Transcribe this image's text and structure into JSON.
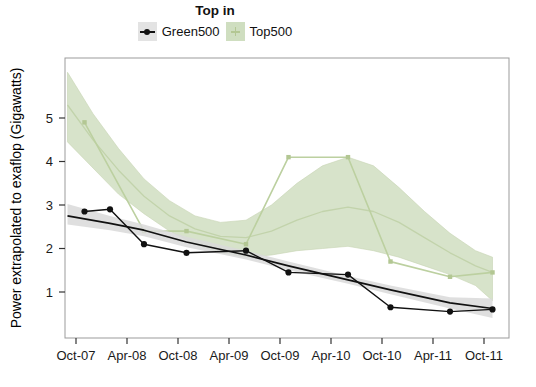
{
  "window": {
    "width": 536,
    "height": 387,
    "background": "#ffffff"
  },
  "legend": {
    "title": "Top in",
    "entries": [
      {
        "label": "Green500",
        "key": "line-with-point",
        "key_bg": "#e3e3e3",
        "color": "#111111"
      },
      {
        "label": "Top500",
        "key": "filled-ribbon",
        "key_bg": "#cfdec0",
        "color": "#b3c793"
      }
    ]
  },
  "chart_data": {
    "type": "line",
    "title": "Top in",
    "xlabel": "",
    "ylabel": "Power extrapolated to exaflop (Gigawatts)",
    "x_unit": "months since Oct-2007",
    "x_tick_labels": [
      "Oct-07",
      "Apr-08",
      "Oct-08",
      "Apr-09",
      "Oct-09",
      "Apr-10",
      "Oct-10",
      "Apr-11",
      "Oct-11"
    ],
    "x_tick_months": [
      0,
      6,
      12,
      18,
      24,
      30,
      36,
      42,
      48
    ],
    "y_ticks": [
      1,
      2,
      3,
      4,
      5
    ],
    "ylim": [
      0,
      6.4
    ],
    "xlim": [
      -1.5,
      50.5
    ],
    "grid": "off",
    "legend_position": "top",
    "series": [
      {
        "name": "Green500",
        "style": "jagged-line-with-circle-markers",
        "color": "#111111",
        "dates": [
          "Nov-07",
          "Feb-08",
          "Jun-08",
          "Nov-08",
          "Jun-09",
          "Nov-09",
          "Jun-10",
          "Nov-10",
          "Jun-11",
          "Nov-11"
        ],
        "x_months": [
          1,
          4,
          8,
          13,
          20,
          25,
          32,
          37,
          44,
          49
        ],
        "values": [
          2.85,
          2.9,
          2.1,
          1.9,
          1.95,
          1.45,
          1.4,
          0.65,
          0.55,
          0.6
        ]
      },
      {
        "name": "Top500",
        "style": "jagged-line-with-small-markers",
        "color": "#bcd0a0",
        "dates": [
          "Nov-07",
          "Jun-08",
          "Nov-08",
          "Jun-09",
          "Nov-09",
          "Jun-10",
          "Nov-10",
          "Jun-11",
          "Nov-11"
        ],
        "x_months": [
          1,
          8,
          13,
          20,
          25,
          32,
          37,
          44,
          49
        ],
        "values": [
          4.9,
          2.4,
          2.4,
          2.1,
          4.1,
          4.1,
          1.7,
          1.35,
          1.45
        ]
      }
    ],
    "smooths": [
      {
        "name": "Top500-trend",
        "line_color": "#c2d3ab",
        "ribbon_color": "#d3e0c4",
        "line": [
          [
            -1,
            5.3
          ],
          [
            2,
            4.5
          ],
          [
            5,
            3.8
          ],
          [
            8,
            3.2
          ],
          [
            11,
            2.75
          ],
          [
            14,
            2.45
          ],
          [
            17,
            2.28
          ],
          [
            20,
            2.25
          ],
          [
            23,
            2.4
          ],
          [
            26,
            2.65
          ],
          [
            29,
            2.85
          ],
          [
            32,
            2.95
          ],
          [
            35,
            2.85
          ],
          [
            38,
            2.6
          ],
          [
            41,
            2.25
          ],
          [
            44,
            1.9
          ],
          [
            47,
            1.6
          ],
          [
            49,
            1.45
          ]
        ],
        "ribbon_top": [
          [
            -1,
            6.05
          ],
          [
            2,
            5.1
          ],
          [
            5,
            4.3
          ],
          [
            8,
            3.6
          ],
          [
            11,
            3.1
          ],
          [
            14,
            2.75
          ],
          [
            17,
            2.6
          ],
          [
            20,
            2.65
          ],
          [
            23,
            3.0
          ],
          [
            26,
            3.5
          ],
          [
            29,
            3.9
          ],
          [
            32,
            4.1
          ],
          [
            35,
            3.9
          ],
          [
            38,
            3.4
          ],
          [
            41,
            2.85
          ],
          [
            44,
            2.35
          ],
          [
            47,
            1.95
          ],
          [
            49,
            1.8
          ]
        ],
        "ribbon_bottom": [
          [
            -1,
            4.45
          ],
          [
            2,
            3.85
          ],
          [
            5,
            3.25
          ],
          [
            8,
            2.8
          ],
          [
            11,
            2.4
          ],
          [
            14,
            2.1
          ],
          [
            17,
            1.9
          ],
          [
            20,
            1.8
          ],
          [
            23,
            1.85
          ],
          [
            26,
            1.95
          ],
          [
            29,
            2.0
          ],
          [
            32,
            2.05
          ],
          [
            35,
            1.95
          ],
          [
            38,
            1.8
          ],
          [
            41,
            1.6
          ],
          [
            44,
            1.4
          ],
          [
            47,
            1.15
          ],
          [
            49,
            0.8
          ]
        ]
      },
      {
        "name": "Green500-trend",
        "line_color": "#111111",
        "ribbon_color": "#d9d9d9",
        "line": [
          [
            -1,
            2.75
          ],
          [
            4,
            2.58
          ],
          [
            8,
            2.42
          ],
          [
            13,
            2.15
          ],
          [
            20,
            1.85
          ],
          [
            25,
            1.6
          ],
          [
            32,
            1.28
          ],
          [
            37,
            1.05
          ],
          [
            44,
            0.75
          ],
          [
            49,
            0.62
          ]
        ],
        "ribbon_top": [
          [
            -1,
            3.02
          ],
          [
            4,
            2.75
          ],
          [
            8,
            2.55
          ],
          [
            13,
            2.27
          ],
          [
            20,
            1.95
          ],
          [
            25,
            1.7
          ],
          [
            32,
            1.37
          ],
          [
            37,
            1.15
          ],
          [
            44,
            0.88
          ],
          [
            49,
            0.85
          ]
        ],
        "ribbon_bottom": [
          [
            -1,
            2.55
          ],
          [
            4,
            2.42
          ],
          [
            8,
            2.28
          ],
          [
            13,
            2.03
          ],
          [
            20,
            1.75
          ],
          [
            25,
            1.5
          ],
          [
            32,
            1.19
          ],
          [
            37,
            0.95
          ],
          [
            44,
            0.62
          ],
          [
            49,
            0.4
          ]
        ]
      }
    ]
  }
}
